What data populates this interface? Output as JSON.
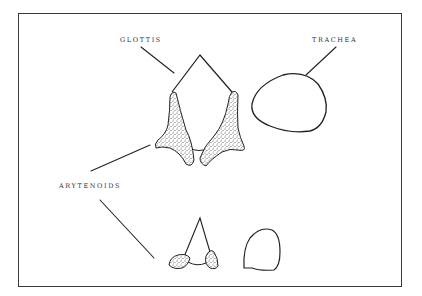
{
  "diagram": {
    "labels": {
      "glottis": "GLOTTIS",
      "trachea": "TRACHEA",
      "arytenoids": "ARYTENOIDS"
    },
    "colors": {
      "stroke": "#222222",
      "stipple": "#444444",
      "frame": "#3a3a3a"
    }
  }
}
